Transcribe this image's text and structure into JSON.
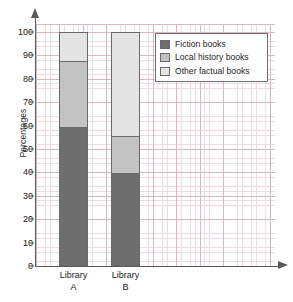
{
  "chart_data": {
    "type": "bar",
    "subtype": "stacked-bar-100",
    "title": "",
    "xlabel": "",
    "ylabel": "Percentages",
    "ylim": [
      0,
      100
    ],
    "yticks": [
      0,
      10,
      20,
      30,
      40,
      50,
      60,
      70,
      80,
      90,
      100
    ],
    "ytick_labels": [
      "0",
      "10",
      "20",
      "30",
      "40",
      "50",
      "60",
      "70",
      "80",
      "90",
      "100"
    ],
    "grid": true,
    "legend_position": "top-right",
    "categories": [
      "Library A",
      "Library B"
    ],
    "category_lines": [
      [
        "Library",
        "A"
      ],
      [
        "Library",
        "B"
      ]
    ],
    "series": [
      {
        "name": "Fiction books",
        "color": "#6e6e6e",
        "values": [
          60,
          40
        ]
      },
      {
        "name": "Local history books",
        "color": "#c3c3c3",
        "values": [
          28,
          16
        ]
      },
      {
        "name": "Other factual books",
        "color": "#e4e4e4",
        "values": [
          12,
          44
        ]
      }
    ],
    "cumulative_tops": {
      "Library A": {
        "Fiction books": 60,
        "Local history books": 88,
        "Other factual books": 100
      },
      "Library B": {
        "Fiction books": 40,
        "Local history books": 56,
        "Other factual books": 100
      }
    }
  },
  "legend": {
    "items": [
      {
        "label": "Fiction books",
        "color": "#6e6e6e"
      },
      {
        "label": "Local history books",
        "color": "#c3c3c3"
      },
      {
        "label": "Other factual books",
        "color": "#e4e4e4"
      }
    ]
  },
  "colors": {
    "axis": "#5a5a5a",
    "grid_minor": "#f0dcdf",
    "grid_major": "#d9b9bd",
    "bar_outline": "#6a6a6a",
    "text": "#222222"
  }
}
